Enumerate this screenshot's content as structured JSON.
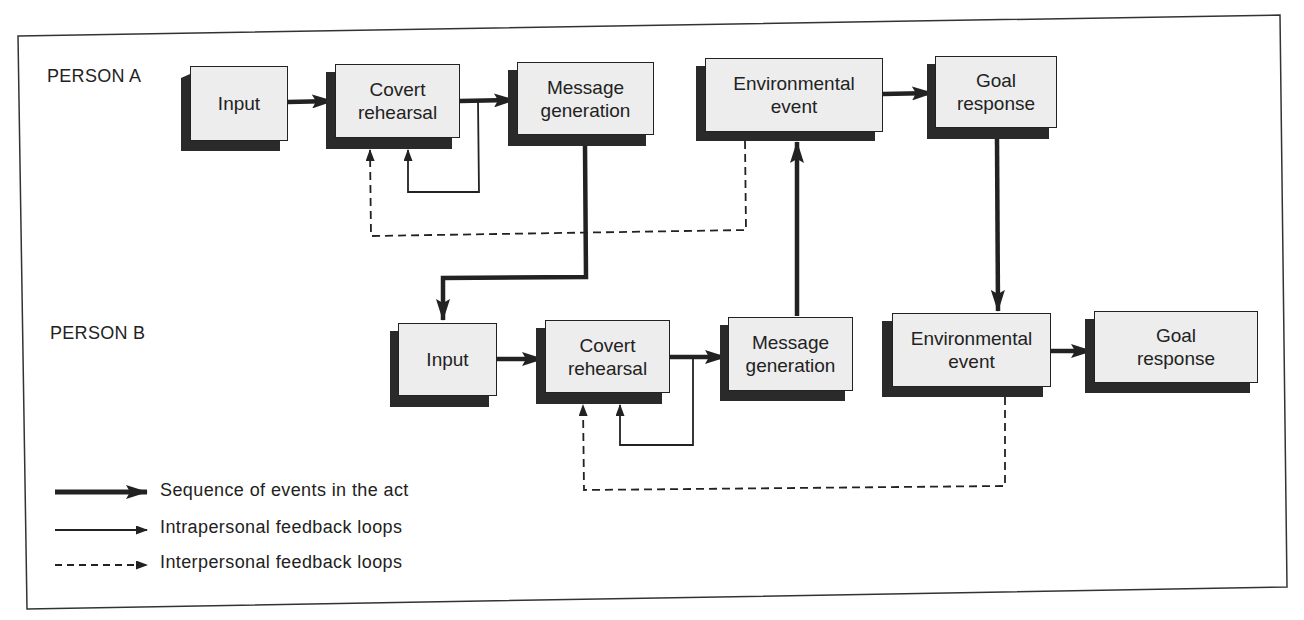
{
  "diagram": {
    "type": "flow",
    "rows": [
      {
        "label": "PERSON A",
        "nodes": [
          {
            "id": "a-input",
            "line1": "Input",
            "line2": ""
          },
          {
            "id": "a-covert",
            "line1": "Covert",
            "line2": "rehearsal"
          },
          {
            "id": "a-message",
            "line1": "Message",
            "line2": "generation"
          },
          {
            "id": "a-env",
            "line1": "Environmental",
            "line2": "event"
          },
          {
            "id": "a-goal",
            "line1": "Goal",
            "line2": "response"
          }
        ]
      },
      {
        "label": "PERSON B",
        "nodes": [
          {
            "id": "b-input",
            "line1": "Input",
            "line2": ""
          },
          {
            "id": "b-covert",
            "line1": "Covert",
            "line2": "rehearsal"
          },
          {
            "id": "b-message",
            "line1": "Message",
            "line2": "generation"
          },
          {
            "id": "b-env",
            "line1": "Environmental",
            "line2": "event"
          },
          {
            "id": "b-goal",
            "line1": "Goal",
            "line2": "response"
          }
        ]
      }
    ],
    "edges": [
      {
        "from": "a-input",
        "to": "a-covert",
        "kind": "sequence"
      },
      {
        "from": "a-covert",
        "to": "a-message",
        "kind": "sequence"
      },
      {
        "from": "a-covert",
        "to": "a-covert",
        "kind": "intrapersonal"
      },
      {
        "from": "a-env",
        "to": "a-covert",
        "kind": "interpersonal"
      },
      {
        "from": "a-env",
        "to": "a-goal",
        "kind": "sequence"
      },
      {
        "from": "a-message",
        "to": "b-input",
        "kind": "sequence"
      },
      {
        "from": "b-message",
        "to": "a-env",
        "kind": "sequence"
      },
      {
        "from": "a-goal",
        "to": "b-env",
        "kind": "sequence"
      },
      {
        "from": "b-input",
        "to": "b-covert",
        "kind": "sequence"
      },
      {
        "from": "b-covert",
        "to": "b-message",
        "kind": "sequence"
      },
      {
        "from": "b-covert",
        "to": "b-covert",
        "kind": "intrapersonal"
      },
      {
        "from": "b-env",
        "to": "b-covert",
        "kind": "interpersonal"
      },
      {
        "from": "b-env",
        "to": "b-goal",
        "kind": "sequence"
      }
    ]
  },
  "legend": {
    "items": [
      {
        "style": "thick-solid",
        "label": "Sequence of events in the act"
      },
      {
        "style": "thin-solid",
        "label": "Intrapersonal feedback loops"
      },
      {
        "style": "dashed",
        "label": "Interpersonal feedback loops"
      }
    ]
  },
  "colors": {
    "line": "#222222",
    "box_face": "#ededed",
    "box_shadow": "#2a2a2a",
    "background": "#ffffff"
  }
}
